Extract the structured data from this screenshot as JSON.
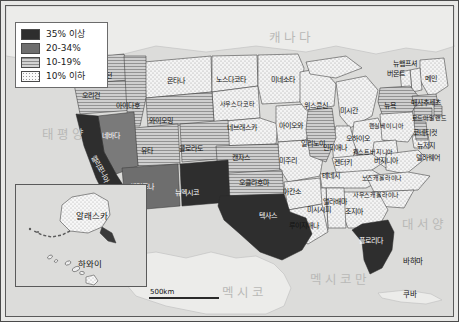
{
  "legend": {
    "title": "",
    "items": [
      {
        "label": "35% 이상",
        "swatch": "#2b2b2b",
        "pattern": "solid-dark"
      },
      {
        "label": "20-34%",
        "swatch": "#6e6e6e",
        "pattern": "solid-mid"
      },
      {
        "label": "10-19%",
        "swatch": "#b5b5b5",
        "pattern": "hatch"
      },
      {
        "label": "10% 이하",
        "swatch": "#f2f2f2",
        "pattern": "dots"
      }
    ]
  },
  "scale": {
    "label": "500km"
  },
  "regions": [
    {
      "name": "태평양",
      "x": 63,
      "y": 132
    },
    {
      "name": "캐나다",
      "x": 290,
      "y": 35
    },
    {
      "name": "멕시코",
      "x": 243,
      "y": 290
    },
    {
      "name": "멕시코만",
      "x": 339,
      "y": 277
    },
    {
      "name": "대서양",
      "x": 423,
      "y": 222
    }
  ],
  "neighbors": [
    {
      "name": "바하마",
      "x": 412,
      "y": 261
    },
    {
      "name": "쿠바",
      "x": 409,
      "y": 294
    }
  ],
  "inset": {
    "alaska": "알래스카",
    "hawaii": "하와이"
  },
  "chart_data": {
    "type": "choropleth",
    "title": "",
    "unit": "%",
    "classes": [
      "35% 이상",
      "20-34%",
      "10-19%",
      "10% 이하"
    ],
    "states": [
      {
        "name": "워싱턴",
        "class": "10-19%",
        "x": 102,
        "y": 75
      },
      {
        "name": "오리건",
        "class": "10-19%",
        "x": 90,
        "y": 95
      },
      {
        "name": "아이다호",
        "class": "10-19%",
        "x": 127,
        "y": 105
      },
      {
        "name": "몬타나",
        "class": "10% 이하",
        "x": 175,
        "y": 80
      },
      {
        "name": "노스다코타",
        "class": "10% 이하",
        "x": 230,
        "y": 79
      },
      {
        "name": "미네소타",
        "class": "10% 이하",
        "x": 282,
        "y": 79
      },
      {
        "name": "사우스다코타",
        "class": "10% 이하",
        "x": 236,
        "y": 103
      },
      {
        "name": "와이오밍",
        "class": "10-19%",
        "x": 160,
        "y": 120
      },
      {
        "name": "네브래스카",
        "class": "10% 이하",
        "x": 241,
        "y": 127
      },
      {
        "name": "아이오와",
        "class": "10% 이하",
        "x": 290,
        "y": 125
      },
      {
        "name": "위스콘신",
        "class": "10% 이하",
        "x": 315,
        "y": 105
      },
      {
        "name": "미시간",
        "class": "10% 이하",
        "x": 348,
        "y": 110
      },
      {
        "name": "네바다",
        "class": "20-34%",
        "x": 110,
        "y": 135
      },
      {
        "name": "유타",
        "class": "10-19%",
        "x": 146,
        "y": 150
      },
      {
        "name": "콜로라도",
        "class": "10-19%",
        "x": 190,
        "y": 148
      },
      {
        "name": "캔자스",
        "class": "10-19%",
        "x": 240,
        "y": 157
      },
      {
        "name": "미주리",
        "class": "10% 이하",
        "x": 287,
        "y": 160
      },
      {
        "name": "일리노이",
        "class": "10-19%",
        "x": 312,
        "y": 143
      },
      {
        "name": "인디애나",
        "class": "10% 이하",
        "x": 334,
        "y": 147
      },
      {
        "name": "오하이오",
        "class": "10% 이하",
        "x": 357,
        "y": 138
      },
      {
        "name": "펜실베이니아",
        "class": "10% 이하",
        "x": 385,
        "y": 125
      },
      {
        "name": "뉴욕",
        "class": "10-19%",
        "x": 389,
        "y": 105
      },
      {
        "name": "버몬트",
        "class": "10% 이하",
        "x": 395,
        "y": 73
      },
      {
        "name": "뉴햄프셔",
        "class": "10% 이하",
        "x": 404,
        "y": 63
      },
      {
        "name": "메인",
        "class": "10% 이하",
        "x": 430,
        "y": 78
      },
      {
        "name": "매사추세츠",
        "class": "10-19%",
        "x": 425,
        "y": 102
      },
      {
        "name": "로드아일랜드",
        "class": "10-19%",
        "x": 428,
        "y": 117
      },
      {
        "name": "코네티컷",
        "class": "10-19%",
        "x": 424,
        "y": 132
      },
      {
        "name": "뉴저지",
        "class": "10-19%",
        "x": 425,
        "y": 145
      },
      {
        "name": "델라웨어",
        "class": "10% 이하",
        "x": 427,
        "y": 157
      },
      {
        "name": "캘리포니아",
        "class": "35% 이상",
        "x": 94,
        "y": 163
      },
      {
        "name": "애리조나",
        "class": "20-34%",
        "x": 141,
        "y": 186
      },
      {
        "name": "뉴멕시코",
        "class": "35% 이상",
        "x": 186,
        "y": 192
      },
      {
        "name": "오클라호마",
        "class": "10-19%",
        "x": 253,
        "y": 182
      },
      {
        "name": "텍사스",
        "class": "35% 이상",
        "x": 267,
        "y": 215
      },
      {
        "name": "아칸소",
        "class": "10% 이하",
        "x": 291,
        "y": 191
      },
      {
        "name": "루이지애나",
        "class": "10% 이하",
        "x": 303,
        "y": 225
      },
      {
        "name": "미시시피",
        "class": "10% 이하",
        "x": 318,
        "y": 209
      },
      {
        "name": "앨라배마",
        "class": "10% 이하",
        "x": 334,
        "y": 201
      },
      {
        "name": "테네시",
        "class": "10% 이하",
        "x": 330,
        "y": 175
      },
      {
        "name": "켄터키",
        "class": "10% 이하",
        "x": 342,
        "y": 162
      },
      {
        "name": "웨스트버지니아",
        "class": "10% 이하",
        "x": 372,
        "y": 151
      },
      {
        "name": "버지니아",
        "class": "10% 이하",
        "x": 385,
        "y": 160
      },
      {
        "name": "노스캐롤라이나",
        "class": "10% 이하",
        "x": 381,
        "y": 177
      },
      {
        "name": "사우스캐롤라이나",
        "class": "10% 이하",
        "x": 375,
        "y": 194
      },
      {
        "name": "조지아",
        "class": "10% 이하",
        "x": 353,
        "y": 211
      },
      {
        "name": "플로리다",
        "class": "35% 이상",
        "x": 370,
        "y": 240
      },
      {
        "name": "알래스카",
        "class": "10% 이하",
        "x": 0,
        "y": 0
      },
      {
        "name": "하와이",
        "class": "10% 이하",
        "x": 0,
        "y": 0
      }
    ]
  }
}
